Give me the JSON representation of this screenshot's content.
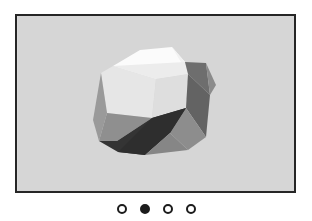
{
  "viewer": {
    "name": "image-carousel",
    "background_color": "#ffffff",
    "frame": {
      "border_color": "#262626",
      "border_width_px": 2,
      "background_color": "#d6d6d6"
    }
  },
  "slide": {
    "label": "Faceted polyhedron illustration",
    "alt_text": "Low-poly grayscale faceted polyhedron rendered on a light gray background",
    "background_color": "#d6d6d6",
    "subject": "low-poly-polyhedron",
    "palette": {
      "highlight": "#fbfbfb",
      "light": "#ededed",
      "light_mid": "#dcdcdc",
      "mid": "#a8a8a8",
      "mid_gray": "#8e8e8e",
      "gray": "#7b7b7b",
      "dark_gray": "#5e5e5e",
      "dark": "#3d3d3d",
      "darkest": "#2b2b2b"
    },
    "facets": [
      {
        "name": "top-highlight",
        "color": "#fbfbfb",
        "points": "113,66 140,50 172,47 185,62 156,79"
      },
      {
        "name": "top-right-highlight",
        "color": "#f2f2f2",
        "points": "172,47 185,62 156,79 188,74"
      },
      {
        "name": "front-left-light",
        "color": "#e6e6e6",
        "points": "101,73 113,66 156,79 152,118 107,113"
      },
      {
        "name": "front-upper-light",
        "color": "#ececec",
        "points": "113,66 156,79 188,74 185,62"
      },
      {
        "name": "front-right-face",
        "color": "#dedede",
        "points": "156,79 188,74 186,108 152,118"
      },
      {
        "name": "right-upper-dark",
        "color": "#6e6e6e",
        "points": "185,62 188,74 210,95 206,63"
      },
      {
        "name": "right-wing-dark",
        "color": "#636363",
        "points": "188,74 210,95 206,137 186,108"
      },
      {
        "name": "right-wing-mid",
        "color": "#8b8b8b",
        "points": "206,63 210,95 216,85"
      },
      {
        "name": "right-lower-mid",
        "color": "#8d8d8d",
        "points": "186,108 206,137 188,150 170,133"
      },
      {
        "name": "left-lower-mid",
        "color": "#9a9a9a",
        "points": "101,73 107,113 99,141 93,120"
      },
      {
        "name": "left-bottom-mid",
        "color": "#8f8f8f",
        "points": "107,113 152,118 117,141 99,141"
      },
      {
        "name": "bottom-dark",
        "color": "#343434",
        "points": "99,141 117,141 152,118 186,108 170,133 145,155 118,152"
      },
      {
        "name": "bottom-shadow",
        "color": "#2e2e2e",
        "points": "118,152 145,155 170,133 186,108 152,118"
      },
      {
        "name": "bottom-right-mid",
        "color": "#868686",
        "points": "170,133 188,150 145,155"
      }
    ]
  },
  "pagination": {
    "name": "carousel-pagination",
    "active_index": 1,
    "dots": [
      {
        "label": "Go to slide 1",
        "active": false
      },
      {
        "label": "Go to slide 2",
        "active": true
      },
      {
        "label": "Go to slide 3",
        "active": false
      },
      {
        "label": "Go to slide 4",
        "active": false
      }
    ],
    "dot_color": "#1c1c1c",
    "dot_inactive_fill": "#ffffff"
  }
}
